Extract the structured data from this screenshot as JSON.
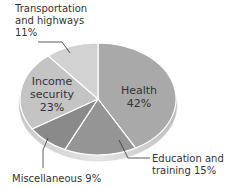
{
  "chart_data": {
    "type": "pie",
    "title": "",
    "categories": [
      "Health",
      "Education and training",
      "Miscellaneous",
      "Income security",
      "Transportation and highways"
    ],
    "values": [
      42,
      15,
      9,
      23,
      11
    ],
    "unit": "%",
    "colors": [
      "#a9a9a9",
      "#959595",
      "#8a8a8a",
      "#c4c4c4",
      "#d2d2d2"
    ],
    "style": "3d-tilted",
    "legend": "none (direct labels)"
  },
  "labels": {
    "health_name": "Health",
    "health_pct": "42%",
    "income_line1": "Income",
    "income_line2": "security",
    "income_pct": "23%",
    "transport_line1": "Transportation",
    "transport_line2": "and highways",
    "transport_pct": "11%",
    "education_line1": "Education and",
    "education_line2": "training 15%",
    "misc": "Miscellaneous 9%"
  }
}
